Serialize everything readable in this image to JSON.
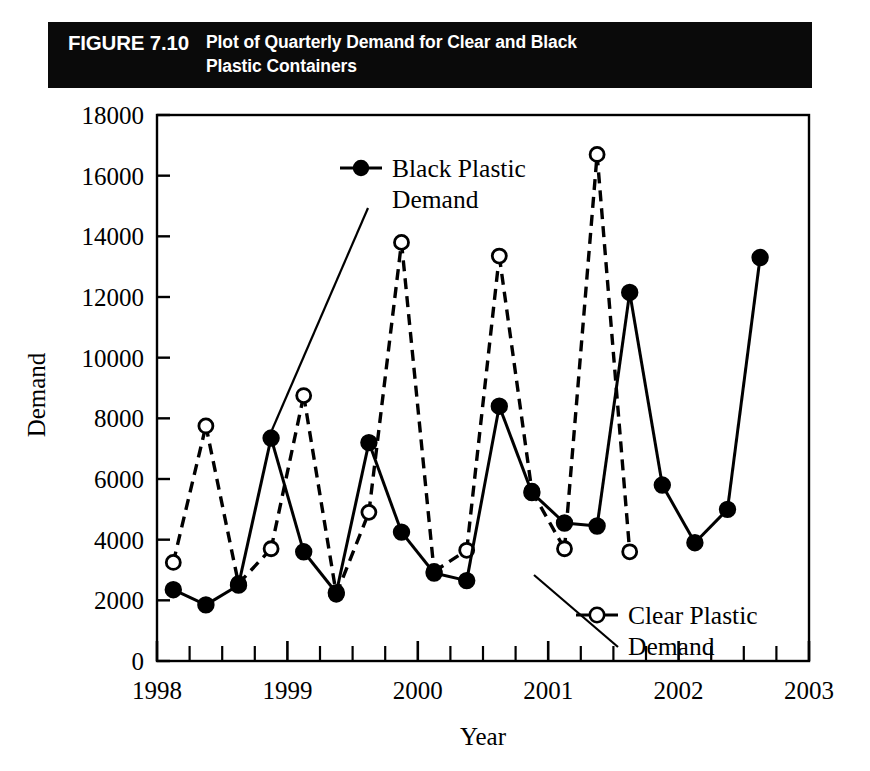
{
  "caption": {
    "figure_number": "FIGURE 7.10",
    "title_line1": "Plot of Quarterly Demand for Clear and Black",
    "title_line2": "Plastic Containers"
  },
  "colors": {
    "banner_background": "#0a0a0a",
    "banner_text": "#ffffff",
    "ink": "#000000",
    "plot_background": "#ffffff"
  },
  "legend": {
    "black_series": {
      "label_line1": "Black Plastic",
      "label_line2": "Demand",
      "marker": "filled-circle",
      "line_style": "solid"
    },
    "clear_series": {
      "label_line1": "Clear Plastic",
      "label_line2": "Demand",
      "marker": "open-circle",
      "line_style": "dashed"
    }
  },
  "chart_data": {
    "type": "line",
    "xlabel": "Year",
    "ylabel": "Demand",
    "xlim": [
      1998.0,
      2003.0
    ],
    "ylim": [
      0,
      18000
    ],
    "ytick_labels": [
      "0",
      "2000",
      "4000",
      "6000",
      "8000",
      "10000",
      "12000",
      "14000",
      "16000",
      "18000"
    ],
    "yticks": [
      0,
      2000,
      4000,
      6000,
      8000,
      10000,
      12000,
      14000,
      16000,
      18000
    ],
    "xtick_labels": [
      "1998",
      "1999",
      "2000",
      "2001",
      "2002",
      "2003"
    ],
    "xticks": [
      1998,
      1999,
      2000,
      2001,
      2002,
      2003
    ],
    "minor_xticks_per_year": 4,
    "grid": false,
    "legend_position": "inside-annotated",
    "x": [
      1998.125,
      1998.375,
      1998.625,
      1998.875,
      1999.125,
      1999.375,
      1999.625,
      1999.875,
      2000.125,
      2000.375,
      2000.625,
      2000.875,
      2001.125,
      2001.375,
      2001.625,
      2001.875,
      2002.125,
      2002.375,
      2002.625,
      2002.875
    ],
    "quarter_labels": [
      "1998 Q1",
      "1998 Q2",
      "1998 Q3",
      "1998 Q4",
      "1999 Q1",
      "1999 Q2",
      "1999 Q3",
      "1999 Q4",
      "2000 Q1",
      "2000 Q2",
      "2000 Q3",
      "2000 Q4",
      "2001 Q1",
      "2001 Q2",
      "2001 Q3",
      "2001 Q4",
      "2002 Q1",
      "2002 Q2",
      "2002 Q3",
      "2002 Q4"
    ],
    "series": [
      {
        "name": "Black Plastic Demand",
        "marker": "filled-circle",
        "line_style": "solid",
        "values": [
          2350,
          1850,
          2500,
          7350,
          3600,
          2250,
          7200,
          4250,
          2900,
          2650,
          8400,
          5550,
          4550,
          4450,
          12150,
          5800,
          3900,
          5000,
          13300,
          null
        ]
      },
      {
        "name": "Clear Plastic Demand",
        "marker": "open-circle",
        "line_style": "dashed",
        "values": [
          3250,
          7750,
          2550,
          3700,
          8750,
          2200,
          4900,
          13800,
          2950,
          3650,
          13350,
          5600,
          3700,
          16700,
          3600,
          null,
          null,
          null,
          null,
          null
        ]
      }
    ],
    "series_note": "Clear series plotted at quarter offsets interleaved with black; null = no point at that slot"
  }
}
